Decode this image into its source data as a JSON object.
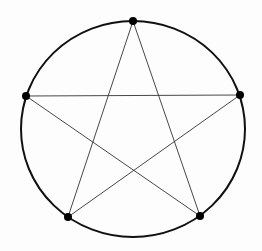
{
  "diagram": {
    "type": "pentagram-inscribed-in-circle",
    "width": 262,
    "height": 251,
    "background": "#fdfdfd",
    "circle": {
      "cx": 133,
      "cy": 129,
      "rx": 112,
      "ry": 108,
      "stroke": "#111111",
      "stroke_width": 2
    },
    "vertices": [
      {
        "id": "top",
        "x": 133,
        "y": 21
      },
      {
        "id": "right",
        "x": 240,
        "y": 95
      },
      {
        "id": "bottom-right",
        "x": 200,
        "y": 216
      },
      {
        "id": "bottom-left",
        "x": 68,
        "y": 217
      },
      {
        "id": "left",
        "x": 26,
        "y": 96
      }
    ],
    "vertex_style": {
      "radius": 4,
      "fill": "#000000"
    },
    "edges": [
      {
        "from": "top",
        "to": "bottom-left"
      },
      {
        "from": "top",
        "to": "bottom-right"
      },
      {
        "from": "left",
        "to": "right"
      },
      {
        "from": "left",
        "to": "bottom-right"
      },
      {
        "from": "right",
        "to": "bottom-left"
      }
    ],
    "edge_style": {
      "stroke": "#333333",
      "stroke_width": 0.9
    }
  }
}
